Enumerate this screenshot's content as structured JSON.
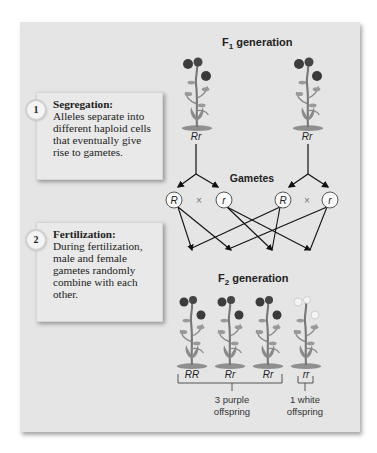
{
  "figure": {
    "f1_label": "F",
    "f1_subscript": "1",
    "f1_suffix": " generation",
    "gametes_label": "Gametes",
    "f2_label": "F",
    "f2_subscript": "2",
    "f2_suffix": " generation",
    "cross_symbol": "×"
  },
  "steps": [
    {
      "number": "1",
      "title": "Segregation:",
      "body": "Alleles separate into different haploid cells that eventually give rise to gametes."
    },
    {
      "number": "2",
      "title": "Fertilization:",
      "body": "During fertilization, male and female gametes randomly combine with each other."
    }
  ],
  "f1_parents": [
    {
      "genotype": "Rr",
      "flower_color": "purple"
    },
    {
      "genotype": "Rr",
      "flower_color": "purple"
    }
  ],
  "gametes": [
    {
      "allele": "R"
    },
    {
      "allele": "r"
    },
    {
      "allele": "R"
    },
    {
      "allele": "r"
    }
  ],
  "f2_offspring": [
    {
      "genotype": "RR",
      "flower_color": "purple"
    },
    {
      "genotype": "Rr",
      "flower_color": "purple"
    },
    {
      "genotype": "Rr",
      "flower_color": "purple"
    },
    {
      "genotype": "rr",
      "flower_color": "white"
    }
  ],
  "summary": {
    "purple_line1": "3 purple",
    "purple_line2": "offspring",
    "white_line1": "1 white",
    "white_line2": "offspring"
  },
  "colors": {
    "purple_flower": "#3a3a3a",
    "white_flower": "#f2f2f2",
    "stem": "#7a7a7a",
    "panel_bg": "#e5e5e5"
  }
}
